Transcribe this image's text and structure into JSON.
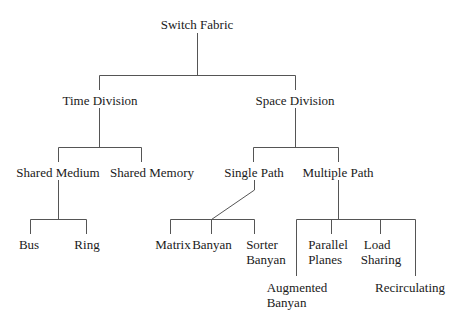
{
  "diagram": {
    "title": "Switch Fabric",
    "line_color": "#555555",
    "nodes": {
      "root": "Switch Fabric",
      "time_division": "Time Division",
      "space_division": "Space Division",
      "shared_medium": "Shared Medium",
      "shared_memory": "Shared Memory",
      "single_path": "Single Path",
      "multiple_path": "Multiple Path",
      "bus": "Bus",
      "ring": "Ring",
      "matrix": "Matrix",
      "banyan": "Banyan",
      "sorter_banyan_1": "Sorter",
      "sorter_banyan_2": "Banyan",
      "augmented_banyan_1": "Augmented",
      "augmented_banyan_2": "Banyan",
      "parallel_planes_1": "Parallel",
      "parallel_planes_2": "Planes",
      "load_sharing_1": "Load",
      "load_sharing_2": "Sharing",
      "recirculating": "Recirculating"
    },
    "hierarchy": {
      "Switch Fabric": [
        "Time Division",
        "Space Division"
      ],
      "Time Division": [
        "Shared Medium",
        "Shared Memory"
      ],
      "Shared Medium": [
        "Bus",
        "Ring"
      ],
      "Space Division": [
        "Single Path",
        "Multiple Path"
      ],
      "Single Path": [
        "Matrix",
        "Banyan",
        "Sorter Banyan"
      ],
      "Multiple Path": [
        "Augmented Banyan",
        "Parallel Planes",
        "Load Sharing",
        "Recirculating"
      ]
    }
  }
}
